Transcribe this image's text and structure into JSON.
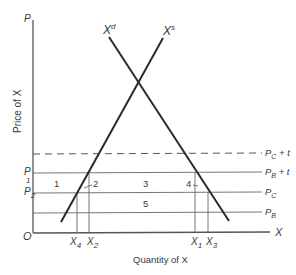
{
  "diagram": {
    "title": "",
    "axes": {
      "origin_label": "O",
      "y_axis_label": "P",
      "y_axis_title": "Price of X",
      "x_axis_label": "X",
      "x_axis_title": "Quantity of X"
    },
    "curves": {
      "demand": {
        "label": "X",
        "superscript": "d"
      },
      "supply": {
        "label": "X",
        "superscript": "s"
      }
    },
    "price_lines": [
      {
        "id": "pc_plus_t",
        "label_main": "P",
        "label_sub": "C",
        "label_suffix": " + t",
        "style": "dashed"
      },
      {
        "id": "pb_plus_t",
        "label_main": "P",
        "label_sub": "B",
        "label_suffix": " + t",
        "style": "solid"
      },
      {
        "id": "pc",
        "label_main": "P",
        "label_sub": "C",
        "label_suffix": "",
        "style": "solid"
      },
      {
        "id": "pb",
        "label_main": "P",
        "label_sub": "B",
        "label_suffix": "",
        "style": "solid"
      }
    ],
    "left_price_labels": [
      {
        "main": "P",
        "sub": "1"
      },
      {
        "main": "P",
        "sub": "2"
      }
    ],
    "quantity_labels": [
      {
        "main": "X",
        "sub": "4"
      },
      {
        "main": "X",
        "sub": "2"
      },
      {
        "main": "X",
        "sub": "1"
      },
      {
        "main": "X",
        "sub": "3"
      }
    ],
    "regions": [
      "1",
      "2",
      "3",
      "4",
      "5"
    ]
  }
}
